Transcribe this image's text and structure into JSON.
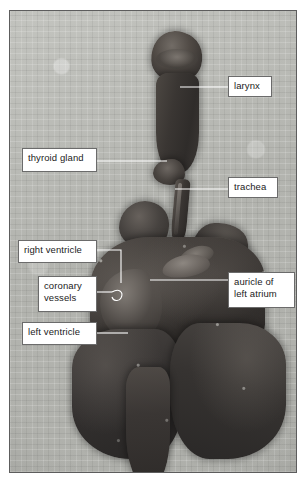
{
  "figure": {
    "kind": "anatomical-specimen-photograph",
    "frame_border_color": "#5d5d5d",
    "background_color": "#b6b7b2",
    "tissue_color": "#3a3633",
    "label_box": {
      "fill": "#ffffff",
      "border": "#6b6b6b",
      "text_color": "#1b1b1b"
    },
    "leader_line_color": "#ffffff"
  },
  "labels": [
    {
      "id": "larynx",
      "text": "larynx",
      "side": "right",
      "lines": 1
    },
    {
      "id": "thyroid_gland",
      "text": "thyroid gland",
      "side": "left",
      "lines": 1
    },
    {
      "id": "trachea",
      "text": "trachea",
      "side": "right",
      "lines": 1
    },
    {
      "id": "right_ventricle",
      "text": "right ventricle",
      "side": "left",
      "lines": 1
    },
    {
      "id": "coronary_vessels",
      "text": "coronary\nvessels",
      "side": "left",
      "lines": 2
    },
    {
      "id": "left_ventricle",
      "text": "left ventricle",
      "side": "left",
      "lines": 1
    },
    {
      "id": "auricle_of_left_atrium",
      "text": "auricle of\nleft atrium",
      "side": "right",
      "lines": 2
    }
  ]
}
